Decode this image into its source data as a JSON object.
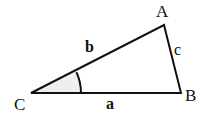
{
  "diagram": {
    "type": "triangle",
    "vertices": {
      "A": {
        "label": "A",
        "x": 164,
        "y": 25
      },
      "B": {
        "label": "B",
        "x": 181,
        "y": 93
      },
      "C": {
        "label": "C",
        "x": 31,
        "y": 93
      }
    },
    "sides": {
      "a": {
        "label": "a",
        "from": "C",
        "to": "B"
      },
      "b": {
        "label": "b",
        "from": "C",
        "to": "A"
      },
      "c": {
        "label": "c",
        "from": "A",
        "to": "B"
      }
    },
    "angle_marker": {
      "vertex": "C",
      "radius": 50
    },
    "colors": {
      "stroke": "#111111",
      "angle_fill": "#efefef",
      "background": "#ffffff"
    }
  }
}
